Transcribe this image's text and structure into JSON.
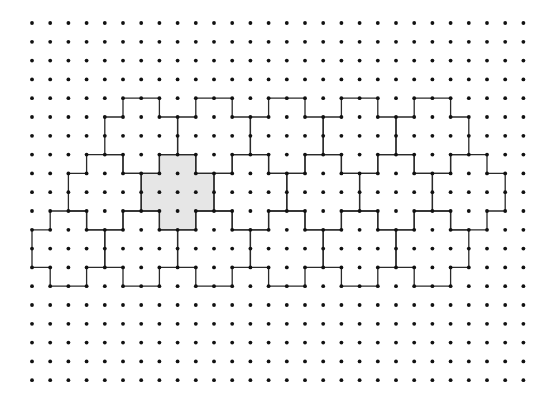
{
  "grid": {
    "columns": 28,
    "rows": 20,
    "origin_x": 32,
    "origin_y": 23,
    "step_x": 18.2,
    "step_y": 18.8,
    "dot_radius": 1.9,
    "dot_color": "#111111"
  },
  "tile_shape": {
    "description": "cross: center 2 wide x 4 tall, arms 4 wide x 2 tall",
    "outline_offsets": [
      [
        0,
        0
      ],
      [
        2,
        0
      ],
      [
        2,
        1
      ],
      [
        3,
        1
      ],
      [
        3,
        3
      ],
      [
        2,
        3
      ],
      [
        2,
        4
      ],
      [
        0,
        4
      ],
      [
        0,
        3
      ],
      [
        -1,
        3
      ],
      [
        -1,
        1
      ],
      [
        0,
        1
      ]
    ]
  },
  "line": {
    "color": "#2a2a2a",
    "width": 1.3
  },
  "shaded": {
    "fill": "#e6e6e6",
    "tile_index": 6
  },
  "tiles": [
    {
      "cx": 5,
      "ry": 4
    },
    {
      "cx": 9,
      "ry": 4
    },
    {
      "cx": 13,
      "ry": 4
    },
    {
      "cx": 17,
      "ry": 4
    },
    {
      "cx": 21,
      "ry": 4
    },
    {
      "cx": 3,
      "ry": 7
    },
    {
      "cx": 7,
      "ry": 7
    },
    {
      "cx": 11,
      "ry": 7
    },
    {
      "cx": 15,
      "ry": 7
    },
    {
      "cx": 19,
      "ry": 7
    },
    {
      "cx": 23,
      "ry": 7
    },
    {
      "cx": 1,
      "ry": 10
    },
    {
      "cx": 5,
      "ry": 10
    },
    {
      "cx": 9,
      "ry": 10
    },
    {
      "cx": 13,
      "ry": 10
    },
    {
      "cx": 17,
      "ry": 10
    },
    {
      "cx": 21,
      "ry": 10
    }
  ]
}
